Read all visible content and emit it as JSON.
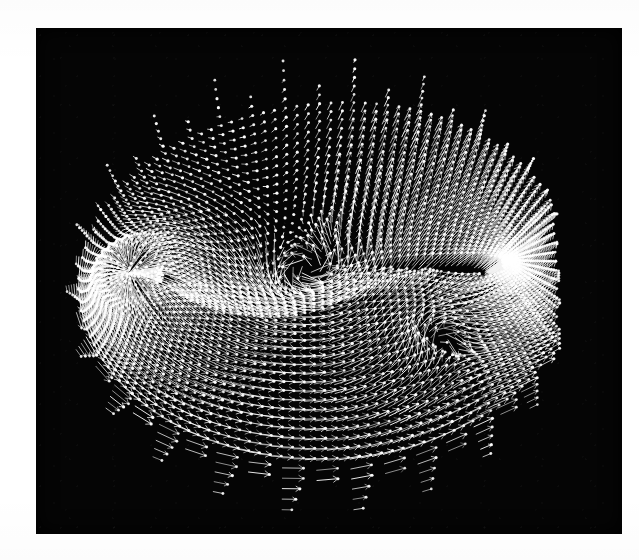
{
  "figure": {
    "domain": "scientific-visualization",
    "kind": "velocity-vector-field",
    "background_color": "#ffffff",
    "plate_color": "#050505",
    "vector_color": "#f2f2f2",
    "tip_color": "#ffffff",
    "canvas": {
      "width": 639,
      "height": 560
    },
    "plate": {
      "x": 36,
      "y": 28,
      "width": 586,
      "height": 506
    }
  },
  "chart_data": {
    "type": "scatter",
    "title": "",
    "subtitle": "",
    "xlabel": "",
    "ylabel": "",
    "legend": [],
    "annotations": [],
    "grid": false,
    "axes_visible": false,
    "tick_labels_x": [],
    "tick_labels_y": [],
    "field": {
      "glyph": "arrow-with-dot-head",
      "n_radial": 34,
      "n_circumferential": 132,
      "center": {
        "x": 318,
        "y": 286
      },
      "outer_radius_x": 252,
      "outer_radius_y": 226,
      "inner_radius_x": 112,
      "inner_radius_y": 16,
      "chord_half_length": 175,
      "body_center": {
        "x": 310,
        "y": 272
      },
      "body_thickness": 44,
      "wake_line_y": 284,
      "freestream_angle_deg": 8,
      "freestream_speed": 1.0,
      "circulation": 0.62,
      "source_strength": 0.34,
      "vortex_core": {
        "x": 430,
        "y": 330,
        "strength": -0.55
      },
      "scale_px_per_unit": 17.5,
      "max_arrow_px": 21,
      "min_arrow_px": 1.5,
      "line_width": 0.95,
      "tip_radius": 1.25,
      "seed": 20240517
    },
    "regions": [
      {
        "name": "upper-suction-surface",
        "note": "dense near-vertical bright arrows, accelerated flow"
      },
      {
        "name": "leading-edge-stagnation",
        "note": "short arrows, near-zero velocity, dark void"
      },
      {
        "name": "lower-pressure-surface",
        "note": "cross-hatched arrow lattice, slower flow"
      },
      {
        "name": "trailing-edge-wake",
        "note": "horizontal row of arrows shedding downstream"
      },
      {
        "name": "outer-farfield",
        "note": "sparse dot-like glyphs at grid boundary"
      }
    ]
  }
}
